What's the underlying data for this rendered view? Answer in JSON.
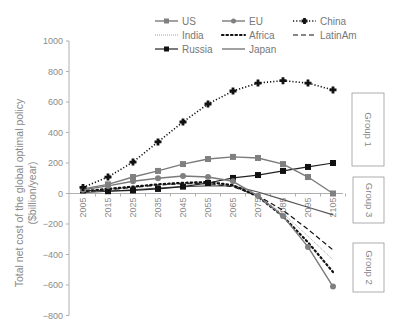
{
  "chart_data": {
    "type": "line",
    "title": "",
    "xlabel": "",
    "ylabel": "Total net cost of the global optimal policy ($billion/year)",
    "ylabel_lines": [
      "Total net cost of the global optimal policy",
      "($billion/year)"
    ],
    "ylim": [
      -800,
      1000
    ],
    "yticks": [
      1000,
      800,
      600,
      400,
      200,
      0,
      -200,
      -400,
      -600,
      -800
    ],
    "ytick_labels": [
      "1000",
      "800",
      "600",
      "400",
      "200",
      "0",
      "−200",
      "−400",
      "−600",
      "−800"
    ],
    "x": [
      2005,
      2015,
      2025,
      2035,
      2045,
      2055,
      2065,
      2075,
      2085,
      2095,
      2105
    ],
    "xtick_labels": [
      "2005",
      "2015",
      "2025",
      "2035",
      "2045",
      "2055",
      "2065",
      "2075",
      "2085",
      "2095",
      "2105"
    ],
    "grid": false,
    "legend_position": "top",
    "series": [
      {
        "name": "US",
        "style": "solid-square",
        "color": "#808080",
        "values": [
          30,
          60,
          108,
          148,
          193,
          226,
          240,
          233,
          193,
          108,
          0
        ]
      },
      {
        "name": "EU",
        "style": "solid-circle",
        "color": "#808080",
        "values": [
          25,
          50,
          80,
          100,
          115,
          108,
          80,
          -16,
          -148,
          -350,
          -610
        ]
      },
      {
        "name": "China",
        "style": "dotted-cross",
        "color": "#111111",
        "values": [
          40,
          108,
          206,
          338,
          469,
          587,
          672,
          724,
          740,
          724,
          679
        ]
      },
      {
        "name": "India",
        "style": "thin-dotted",
        "color": "#888888",
        "values": [
          10,
          25,
          40,
          55,
          65,
          70,
          50,
          -20,
          -130,
          -280,
          -435
        ]
      },
      {
        "name": "Africa",
        "style": "bold-dotted",
        "color": "#111111",
        "values": [
          15,
          30,
          45,
          60,
          70,
          75,
          55,
          -20,
          -150,
          -320,
          -515
        ]
      },
      {
        "name": "LatinAm",
        "style": "dashed",
        "color": "#111111",
        "values": [
          10,
          25,
          40,
          55,
          65,
          65,
          45,
          -15,
          -110,
          -235,
          -370
        ]
      },
      {
        "name": "Russia",
        "style": "solid-square-dark",
        "color": "#222222",
        "values": [
          20,
          15,
          20,
          30,
          45,
          69,
          102,
          121,
          148,
          174,
          200
        ]
      },
      {
        "name": "Japan",
        "style": "solid-plain",
        "color": "#555555",
        "values": [
          5,
          15,
          25,
          35,
          45,
          50,
          50,
          10,
          -40,
          -90,
          -140
        ]
      }
    ],
    "annotations": [
      {
        "text": "Group 1",
        "box": true
      },
      {
        "text": "Group 3",
        "box": true
      },
      {
        "text": "Group 2",
        "box": true
      }
    ]
  },
  "legend": {
    "items": [
      "US",
      "EU",
      "China",
      "India",
      "Africa",
      "LatinAm",
      "Russia",
      "Japan"
    ]
  },
  "groups": {
    "g1": "Group 1",
    "g2": "Group 2",
    "g3": "Group 3"
  }
}
